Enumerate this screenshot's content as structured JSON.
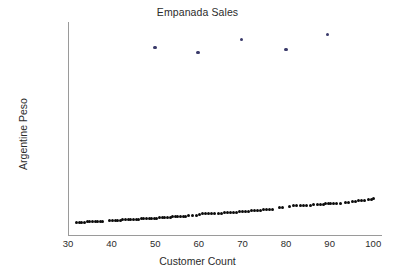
{
  "chart_data": {
    "type": "scatter",
    "title": "Empanada Sales",
    "xlabel": "Customer Count",
    "ylabel": "Argentine Peso",
    "xlim": [
      30,
      102
    ],
    "ylim": [
      0,
      104000
    ],
    "xticks": [
      30,
      40,
      50,
      60,
      70,
      80,
      90,
      100
    ],
    "yticks": [
      20000,
      40000,
      60000,
      80000,
      100000
    ],
    "grid": false,
    "legend": null,
    "series": [
      {
        "name": "main",
        "color": "#0b0b0b",
        "marker": "circle",
        "points": [
          [
            32.0,
            6100
          ],
          [
            32.6,
            6150
          ],
          [
            33.2,
            6250
          ],
          [
            33.8,
            6300
          ],
          [
            34.4,
            6400
          ],
          [
            35.0,
            6450
          ],
          [
            35.6,
            6500
          ],
          [
            36.2,
            6550
          ],
          [
            36.8,
            6600
          ],
          [
            37.4,
            6650
          ],
          [
            38.0,
            6700
          ],
          [
            39.6,
            7000
          ],
          [
            40.2,
            7100
          ],
          [
            40.8,
            7200
          ],
          [
            41.4,
            7250
          ],
          [
            42.0,
            7300
          ],
          [
            42.6,
            7350
          ],
          [
            43.2,
            7400
          ],
          [
            43.8,
            7500
          ],
          [
            44.4,
            7550
          ],
          [
            45.0,
            7650
          ],
          [
            45.6,
            7700
          ],
          [
            46.2,
            7800
          ],
          [
            46.8,
            7850
          ],
          [
            47.4,
            7950
          ],
          [
            48.0,
            8000
          ],
          [
            48.6,
            8100
          ],
          [
            49.2,
            8150
          ],
          [
            49.8,
            8250
          ],
          [
            50.4,
            8300
          ],
          [
            51.0,
            8400
          ],
          [
            51.6,
            8450
          ],
          [
            52.2,
            8550
          ],
          [
            52.8,
            8600
          ],
          [
            53.4,
            8700
          ],
          [
            54.0,
            8800
          ],
          [
            54.6,
            8900
          ],
          [
            55.2,
            9000
          ],
          [
            55.8,
            9050
          ],
          [
            56.4,
            9150
          ],
          [
            57.0,
            9250
          ],
          [
            57.6,
            9400
          ],
          [
            58.6,
            9500
          ],
          [
            59.4,
            9700
          ],
          [
            60.2,
            10200
          ],
          [
            60.9,
            10300
          ],
          [
            61.6,
            10400
          ],
          [
            62.3,
            10450
          ],
          [
            63.0,
            10500
          ],
          [
            63.7,
            10550
          ],
          [
            64.4,
            10600
          ],
          [
            65.1,
            10700
          ],
          [
            65.8,
            10800
          ],
          [
            66.5,
            10900
          ],
          [
            67.2,
            11000
          ],
          [
            67.9,
            11100
          ],
          [
            68.6,
            11200
          ],
          [
            69.3,
            11300
          ],
          [
            70.0,
            11450
          ],
          [
            70.7,
            11550
          ],
          [
            71.4,
            11650
          ],
          [
            72.1,
            11750
          ],
          [
            72.8,
            11900
          ],
          [
            73.5,
            12000
          ],
          [
            74.2,
            12100
          ],
          [
            74.9,
            12250
          ],
          [
            75.6,
            12350
          ],
          [
            76.3,
            12500
          ],
          [
            77.0,
            12600
          ],
          [
            78.4,
            13300
          ],
          [
            79.2,
            13400
          ],
          [
            80.8,
            14100
          ],
          [
            81.6,
            14200
          ],
          [
            82.4,
            14300
          ],
          [
            83.2,
            14350
          ],
          [
            84.0,
            14400
          ],
          [
            84.8,
            14500
          ],
          [
            85.6,
            14600
          ],
          [
            86.4,
            14700
          ],
          [
            87.2,
            14900
          ],
          [
            87.9,
            15000
          ],
          [
            88.5,
            15100
          ],
          [
            89.1,
            15200
          ],
          [
            89.7,
            15250
          ],
          [
            90.3,
            15300
          ],
          [
            90.9,
            15350
          ],
          [
            91.6,
            15300
          ],
          [
            92.4,
            15250
          ],
          [
            93.6,
            15900
          ],
          [
            94.4,
            16000
          ],
          [
            95.2,
            16200
          ],
          [
            96.0,
            16600
          ],
          [
            96.7,
            16700
          ],
          [
            97.4,
            16750
          ],
          [
            98.1,
            16900
          ],
          [
            98.8,
            17200
          ],
          [
            99.5,
            17400
          ],
          [
            100.0,
            17600
          ]
        ]
      },
      {
        "name": "outliers",
        "color": "#3a3a6a",
        "marker": "circle",
        "points": [
          [
            50.0,
            91500
          ],
          [
            59.8,
            89000
          ],
          [
            69.8,
            95500
          ],
          [
            80.0,
            90500
          ],
          [
            89.5,
            98000
          ]
        ]
      }
    ]
  },
  "axes": {
    "title": "Empanada Sales",
    "x_label": "Customer Count",
    "y_label": "Argentine Peso",
    "x_tick_labels": [
      "30",
      "40",
      "50",
      "60",
      "70",
      "80",
      "90",
      "100"
    ],
    "y_tick_labels": [
      "20000",
      "40000",
      "60000",
      "80000",
      "100000"
    ]
  },
  "colors": {
    "main_point": "#0b0b0b",
    "outlier_point": "#3a3a6a",
    "axis_line": "#9a9a9a",
    "text": "#2b2b2b",
    "background": "#ffffff"
  }
}
